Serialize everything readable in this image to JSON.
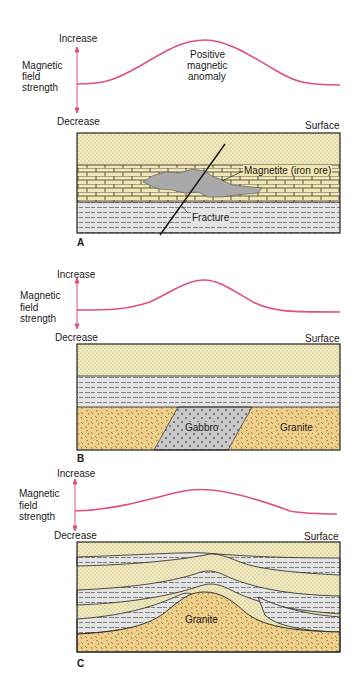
{
  "figure": {
    "colors": {
      "curve": "#e0507a",
      "sandstone": "#f3ebbd",
      "limestone": "#f3e7b4",
      "shale": "#e2e2e2",
      "granite": "#f0cf8a",
      "gabbro": "#c8c8c8",
      "magnetite": "#a9a9a9",
      "outline": "#222222"
    },
    "panels": [
      {
        "letter": "A",
        "axis": {
          "title_lines": [
            "Magnetic",
            "field",
            "strength"
          ],
          "increase": "Increase",
          "decrease": "Decrease"
        },
        "curve_label_lines": [
          "Positive",
          "magnetic",
          "anomaly"
        ],
        "surface": "Surface",
        "labels": {
          "ore": "Magnetite (iron ore)",
          "fracture": "Fracture"
        },
        "layers": [
          "sandstone",
          "limestone",
          "shale"
        ]
      },
      {
        "letter": "B",
        "axis": {
          "title_lines": [
            "Magnetic",
            "field",
            "strength"
          ],
          "increase": "Increase",
          "decrease": "Decrease"
        },
        "surface": "Surface",
        "labels": {
          "gabbro": "Gabbro",
          "granite": "Granite"
        },
        "layers": [
          "sandstone",
          "shale",
          "granite with gabbro intrusion"
        ]
      },
      {
        "letter": "C",
        "axis": {
          "title_lines": [
            "Magnetic",
            "field",
            "strength"
          ],
          "increase": "Increase",
          "decrease": "Decrease"
        },
        "surface": "Surface",
        "labels": {
          "granite": "Granite"
        },
        "layers": [
          "sandstone/shale folded layers",
          "granite dome"
        ]
      }
    ]
  }
}
